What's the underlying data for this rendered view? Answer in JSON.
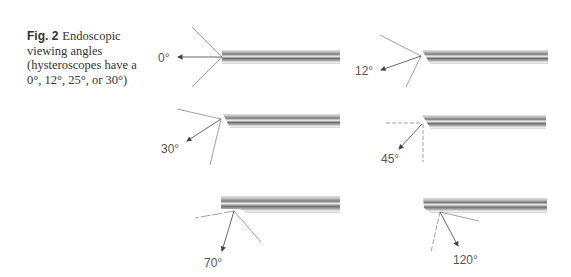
{
  "figure": {
    "label": "Fig. 2",
    "caption": "Endoscopic viewing angles (hysteroscopes have a 0°, 12°, 25°, or 30°)"
  },
  "scopes": [
    {
      "angle_label": "0°",
      "angle": 0
    },
    {
      "angle_label": "12°",
      "angle": 12
    },
    {
      "angle_label": "30°",
      "angle": 30
    },
    {
      "angle_label": "45°",
      "angle": 45
    },
    {
      "angle_label": "70°",
      "angle": 70
    },
    {
      "angle_label": "120°",
      "angle": 120
    }
  ],
  "colors": {
    "line": "#777777",
    "tube_dark": "#6a6a6a",
    "tube_light": "#d8d8d8"
  }
}
